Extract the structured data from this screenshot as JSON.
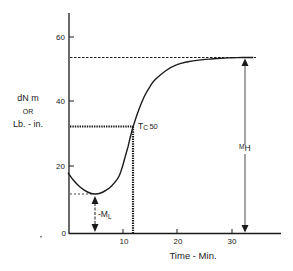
{
  "chart_data": {
    "type": "line",
    "title": "",
    "xlabel": "Time - Min.",
    "ylabel_lines": [
      "dN m",
      "OR",
      "Lb. - in."
    ],
    "xlim": [
      0,
      38
    ],
    "ylim": [
      0,
      70
    ],
    "xticks": [
      10,
      20,
      30
    ],
    "yticks": [
      0,
      20,
      40,
      60
    ],
    "grid": false,
    "series": [
      {
        "name": "cure curve",
        "x": [
          0,
          1,
          2,
          3,
          4,
          5,
          6,
          7,
          8,
          9,
          9.5,
          10,
          10.5,
          11,
          11.5,
          12,
          13,
          14,
          15,
          16,
          18,
          20,
          22,
          24,
          26,
          28,
          30,
          32,
          34
        ],
        "y": [
          18.5,
          16.2,
          14.5,
          13.2,
          12.3,
          12.0,
          12.3,
          13.2,
          14.5,
          16.5,
          18.0,
          20.5,
          23.5,
          26.5,
          30.0,
          33.0,
          38.0,
          42.0,
          45.0,
          47.2,
          50.0,
          51.8,
          52.7,
          53.2,
          53.5,
          53.8,
          53.9,
          54.0,
          54.0
        ]
      }
    ],
    "annotations": {
      "ML": {
        "label": "-M",
        "sub": "L",
        "t": 5,
        "value": 12
      },
      "MH": {
        "label": "M",
        "sub": "H",
        "t": 32,
        "value": 54
      },
      "Tc50": {
        "label": "T",
        "sub": "C",
        "suffix": " 50",
        "t": 12,
        "value": 32.6
      }
    }
  },
  "labels": {
    "y60": "60",
    "y40": "40",
    "y20": "20",
    "y0": "0",
    "x10": "10",
    "x20": "20",
    "x30": "30",
    "xlabel": "Time - Min.",
    "ylabel1": "dN m",
    "ylabel2": "OR",
    "ylabel3": "Lb. - in.",
    "ml_main": "-M",
    "ml_sub": "L",
    "mh_main": "M",
    "mh_sub": "H",
    "tc_main": "T",
    "tc_sub": "C",
    "tc_suffix": "50"
  },
  "colors": {
    "ink": "#1a1a1a",
    "background": "#ffffff"
  }
}
